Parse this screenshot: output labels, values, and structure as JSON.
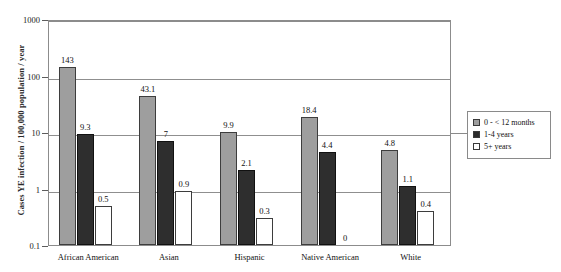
{
  "chart_data": {
    "type": "bar",
    "title": "",
    "xlabel": "",
    "ylabel": "Cases YE infection / 100,000 population / year",
    "yscale": "log",
    "ylim": [
      0.1,
      1000
    ],
    "ytick_labels": [
      "1000",
      "100",
      "10",
      "1",
      "0.1"
    ],
    "ytick_values": [
      1000,
      100,
      10,
      1,
      0.1
    ],
    "grid": true,
    "legend_position": "right",
    "categories": [
      "African American",
      "Asian",
      "Hispanic",
      "Native American",
      "White"
    ],
    "series": [
      {
        "name": "0 - < 12 months",
        "color": "#9e9e9e",
        "values": [
          143,
          43.1,
          9.9,
          18.4,
          4.8
        ],
        "labels": [
          "143",
          "43.1",
          "9.9",
          "18.4",
          "4.8"
        ]
      },
      {
        "name": "1-4 years",
        "color": "#2e2e2e",
        "values": [
          9.3,
          7,
          2.1,
          4.4,
          1.1
        ],
        "labels": [
          "9.3",
          "7",
          "2.1",
          "4.4",
          "1.1"
        ]
      },
      {
        "name": "5+ years",
        "color": "#ffffff",
        "values": [
          0.5,
          0.9,
          0.3,
          0,
          0.4
        ],
        "labels": [
          "0.5",
          "0.9",
          "0.3",
          "0",
          "0.4"
        ]
      }
    ]
  },
  "axis": {
    "y_title": "Cases YE infection / 100,000 population / year",
    "ticks": [
      "1000",
      "100",
      "10",
      "1",
      "0.1"
    ]
  },
  "legend": {
    "items": [
      {
        "label": "0 - < 12 months"
      },
      {
        "label": "1-4 years"
      },
      {
        "label": "5+ years"
      }
    ]
  },
  "categories": {
    "c0": "African American",
    "c1": "Asian",
    "c2": "Hispanic",
    "c3": "Native American",
    "c4": "White"
  },
  "title_sliver": ""
}
